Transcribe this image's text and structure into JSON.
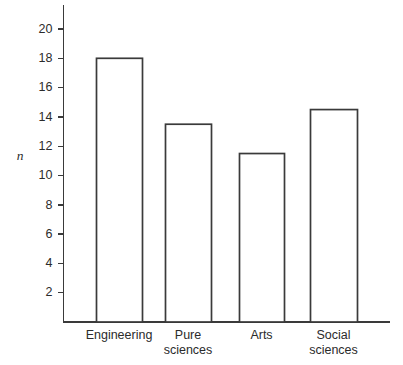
{
  "chart_data": {
    "type": "bar",
    "title": "",
    "xlabel": "",
    "ylabel": "n",
    "categories": [
      "Engineering",
      "Pure sciences",
      "Arts",
      "Social sciences"
    ],
    "category_lines": [
      [
        "Engineering"
      ],
      [
        "Pure",
        "sciences"
      ],
      [
        "Arts"
      ],
      [
        "Social",
        "sciences"
      ]
    ],
    "values": [
      18.0,
      13.5,
      11.5,
      14.5
    ],
    "ylim": [
      0,
      21
    ],
    "yticks": [
      2,
      4,
      6,
      8,
      10,
      12,
      14,
      16,
      18,
      20
    ],
    "ytick_labels": [
      "2",
      "4",
      "6",
      "8",
      "10",
      "12",
      "14",
      "16",
      "18",
      "20"
    ],
    "grid": false,
    "legend": false,
    "bar_fill": "#ffffff",
    "bar_stroke": "#3a3a3a",
    "axis_color": "#3a3a3a",
    "background": "#ffffff"
  }
}
